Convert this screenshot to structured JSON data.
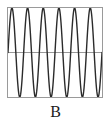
{
  "figure": {
    "panel_label": "B",
    "background_color": "#ffffff",
    "border_color": "#9a9a9a",
    "wave_color": "#2b2b2b",
    "axis_color": "#8c8c8c"
  },
  "chart_data": {
    "type": "line",
    "title": "",
    "subtitle": "",
    "xlabel": "",
    "ylabel": "",
    "annotations": [
      "B"
    ],
    "legend": [],
    "legend_position": "none",
    "grid": false,
    "xlim": [
      0,
      6
    ],
    "ylim": [
      -1,
      1
    ],
    "xticks": [],
    "yticks": [],
    "xticklabels": [],
    "yticklabels": [],
    "axis_hline": 0,
    "series": [
      {
        "name": "sine-wave",
        "waveform": "sine",
        "cycles": 6,
        "amplitude": 1,
        "phase": 0,
        "offset": 0,
        "color": "#2b2b2b",
        "linewidth": 1.4,
        "samples_x": [
          0,
          0.0625,
          0.125,
          0.1875,
          0.25,
          0.3125,
          0.375,
          0.4375,
          0.5,
          0.5625,
          0.625,
          0.6875,
          0.75,
          0.8125,
          0.875,
          0.9375,
          1
        ],
        "samples_y": [
          0,
          0.383,
          0.707,
          0.924,
          1,
          0.924,
          0.707,
          0.383,
          0,
          -0.383,
          -0.707,
          -0.924,
          -1,
          -0.924,
          -0.707,
          -0.383,
          0
        ]
      }
    ]
  }
}
